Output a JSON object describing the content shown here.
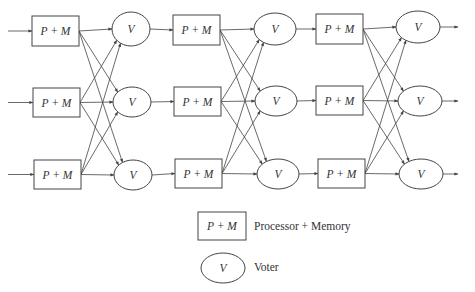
{
  "diagram": {
    "stages": 3,
    "rows": 3,
    "processor_label": "P + M",
    "voter_label": "V",
    "colors": {
      "stroke": "#444444",
      "text": "#333333",
      "background": "#ffffff"
    },
    "processors": [
      {
        "stage": 0,
        "row": 0,
        "x": 32,
        "y": 16,
        "w": 47,
        "h": 30
      },
      {
        "stage": 0,
        "row": 1,
        "x": 33,
        "y": 88,
        "w": 47,
        "h": 29
      },
      {
        "stage": 0,
        "row": 2,
        "x": 34,
        "y": 160,
        "w": 47,
        "h": 29
      },
      {
        "stage": 1,
        "row": 0,
        "x": 173,
        "y": 15,
        "w": 47,
        "h": 30
      },
      {
        "stage": 1,
        "row": 1,
        "x": 174,
        "y": 87,
        "w": 47,
        "h": 29
      },
      {
        "stage": 1,
        "row": 2,
        "x": 175,
        "y": 159,
        "w": 47,
        "h": 29
      },
      {
        "stage": 2,
        "row": 0,
        "x": 316,
        "y": 14,
        "w": 47,
        "h": 30
      },
      {
        "stage": 2,
        "row": 1,
        "x": 316,
        "y": 86,
        "w": 47,
        "h": 29
      },
      {
        "stage": 2,
        "row": 2,
        "x": 318,
        "y": 159,
        "w": 47,
        "h": 29
      }
    ],
    "voters": [
      {
        "stage": 0,
        "row": 0,
        "cx": 131,
        "cy": 29,
        "rx": 19,
        "ry": 17
      },
      {
        "stage": 0,
        "row": 1,
        "cx": 132,
        "cy": 102,
        "rx": 19,
        "ry": 15
      },
      {
        "stage": 0,
        "row": 2,
        "cx": 133,
        "cy": 175,
        "rx": 19,
        "ry": 15
      },
      {
        "stage": 1,
        "row": 0,
        "cx": 275,
        "cy": 29,
        "rx": 21,
        "ry": 16
      },
      {
        "stage": 1,
        "row": 1,
        "cx": 276,
        "cy": 101,
        "rx": 21,
        "ry": 15
      },
      {
        "stage": 1,
        "row": 2,
        "cx": 278,
        "cy": 174,
        "rx": 21,
        "ry": 15
      },
      {
        "stage": 2,
        "row": 0,
        "cx": 418,
        "cy": 27,
        "rx": 22,
        "ry": 16
      },
      {
        "stage": 2,
        "row": 1,
        "cx": 420,
        "cy": 101,
        "rx": 22,
        "ry": 15
      },
      {
        "stage": 2,
        "row": 2,
        "cx": 421,
        "cy": 174,
        "rx": 22,
        "ry": 15
      }
    ],
    "inputs": [
      {
        "x1": 8,
        "y": 31
      },
      {
        "x1": 8,
        "y": 102
      },
      {
        "x1": 8,
        "y": 175
      }
    ],
    "output_end_x": 458
  },
  "legend": {
    "items": [
      {
        "symbol": "rect",
        "symbol_label": "P + M",
        "text": "Processor + Memory"
      },
      {
        "symbol": "ellipse",
        "symbol_label": "V",
        "text": "Voter"
      }
    ]
  }
}
